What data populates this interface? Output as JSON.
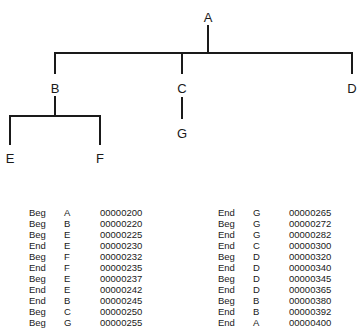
{
  "tree": {
    "nodes": [
      {
        "id": "A",
        "label": "A",
        "x": 208,
        "y": 17
      },
      {
        "id": "B",
        "label": "B",
        "x": 55,
        "y": 88
      },
      {
        "id": "C",
        "label": "C",
        "x": 182,
        "y": 88
      },
      {
        "id": "D",
        "label": "D",
        "x": 352,
        "y": 88
      },
      {
        "id": "E",
        "label": "E",
        "x": 10,
        "y": 158
      },
      {
        "id": "F",
        "label": "F",
        "x": 100,
        "y": 158
      },
      {
        "id": "G",
        "label": "G",
        "x": 182,
        "y": 133
      }
    ],
    "edges": [
      {
        "from": "A",
        "to": "B"
      },
      {
        "from": "A",
        "to": "C"
      },
      {
        "from": "A",
        "to": "D"
      },
      {
        "from": "B",
        "to": "E"
      },
      {
        "from": "B",
        "to": "F"
      },
      {
        "from": "C",
        "to": "G"
      }
    ]
  },
  "trace_left": [
    {
      "event": "Beg",
      "node": "A",
      "time": "00000200"
    },
    {
      "event": "Beg",
      "node": "B",
      "time": "00000220"
    },
    {
      "event": "Beg",
      "node": "E",
      "time": "00000225"
    },
    {
      "event": "End",
      "node": "E",
      "time": "00000230"
    },
    {
      "event": "Beg",
      "node": "F",
      "time": "00000232"
    },
    {
      "event": "End",
      "node": "F",
      "time": "00000235"
    },
    {
      "event": "Beg",
      "node": "E",
      "time": "00000237"
    },
    {
      "event": "End",
      "node": "E",
      "time": "00000242"
    },
    {
      "event": "End",
      "node": "B",
      "time": "00000245"
    },
    {
      "event": "Beg",
      "node": "C",
      "time": "00000250"
    },
    {
      "event": "Beg",
      "node": "G",
      "time": "00000255"
    }
  ],
  "trace_right": [
    {
      "event": "End",
      "node": "G",
      "time": "00000265"
    },
    {
      "event": "Beg",
      "node": "G",
      "time": "00000272"
    },
    {
      "event": "End",
      "node": "G",
      "time": "00000282"
    },
    {
      "event": "End",
      "node": "C",
      "time": "00000300"
    },
    {
      "event": "Beg",
      "node": "D",
      "time": "00000320"
    },
    {
      "event": "End",
      "node": "D",
      "time": "00000340"
    },
    {
      "event": "Beg",
      "node": "D",
      "time": "00000345"
    },
    {
      "event": "End",
      "node": "D",
      "time": "00000365"
    },
    {
      "event": "Beg",
      "node": "B",
      "time": "00000380"
    },
    {
      "event": "End",
      "node": "B",
      "time": "00000392"
    },
    {
      "event": "End",
      "node": "A",
      "time": "00000400"
    }
  ]
}
